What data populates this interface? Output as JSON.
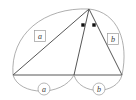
{
  "figure": {
    "type": "geometry-diagram",
    "background_color": "#ffffff",
    "line_color": "#2b2b2b",
    "arc_color": "#8c8c8c",
    "label_color": "#3a3a3a",
    "dot_color": "#111111",
    "vertices": [
      {
        "id": "left",
        "x": 13,
        "y": 75
      },
      {
        "id": "foot",
        "x": 74,
        "y": 75
      },
      {
        "id": "right",
        "x": 122,
        "y": 75
      },
      {
        "id": "apex",
        "x": 89,
        "y": 9
      }
    ],
    "edges": [
      {
        "name": "left-to-apex",
        "from": "left",
        "to": "apex"
      },
      {
        "name": "base-left-to-right",
        "from": "left",
        "to": "right"
      },
      {
        "name": "apex-to-foot",
        "from": "apex",
        "to": "foot"
      },
      {
        "name": "apex-to-right",
        "from": "apex",
        "to": "right"
      }
    ],
    "arcs": [
      {
        "name": "upper-left-arc",
        "from": "left",
        "to": "apex",
        "label": "a",
        "label_style": "boxed",
        "label_x": 40,
        "label_y": 36
      },
      {
        "name": "upper-right-arc",
        "from": "apex",
        "to": "right",
        "label": "b",
        "label_style": "boxed",
        "label_x": 113,
        "label_y": 39
      },
      {
        "name": "lower-left-arc",
        "from": "left",
        "to": "foot",
        "label": "a",
        "label_style": "circled",
        "label_x": 44,
        "label_y": 89
      },
      {
        "name": "lower-right-arc",
        "from": "foot",
        "to": "right",
        "label": "b",
        "label_style": "circled",
        "label_x": 99,
        "label_y": 89
      }
    ],
    "angle_marks": {
      "name": "equal-angle-dots-at-apex",
      "count": 2,
      "dots": [
        {
          "x": 83,
          "y": 25
        },
        {
          "x": 94,
          "y": 25
        }
      ]
    },
    "labels": {
      "upper_left": "a",
      "upper_right": "b",
      "lower_left": "a",
      "lower_right": "b"
    }
  }
}
